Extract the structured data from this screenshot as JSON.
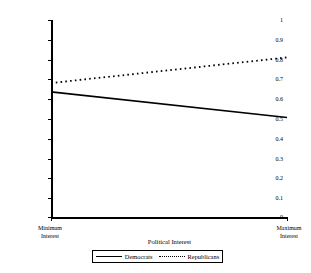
{
  "chart_data": {
    "type": "line",
    "title": "",
    "xlabel": "Political Interest",
    "ylabel": "U.S. Involvement in Iraq is Going Well",
    "xlim": [
      0,
      1
    ],
    "ylim": [
      0,
      1
    ],
    "grid": false,
    "legend_position": "bottom-center",
    "x_tick_labels": [
      "Minimum\nInterest",
      "Maximum\nInterest"
    ],
    "y_tick_labels": [
      "0",
      "0.1",
      "0.2",
      "0.3",
      "0.4",
      "0.5",
      "0.6",
      "0.7",
      "0.8",
      "0.9",
      "1"
    ],
    "y_tick_values": [
      0,
      0.1,
      0.2,
      0.3,
      0.4,
      0.5,
      0.6,
      0.7,
      0.8,
      0.9,
      1
    ],
    "x": [
      0,
      1
    ],
    "series": [
      {
        "name": "Democrats",
        "style": "solid",
        "color": "#000000",
        "values": [
          0.635,
          0.505
        ]
      },
      {
        "name": "Republicans",
        "style": "dotted",
        "color": "#000000",
        "values": [
          0.68,
          0.81
        ]
      }
    ]
  },
  "axes": {
    "y_title": "U.S. Involvement in Iraq is Going Well",
    "x_title": "Political Interest",
    "x_min_label_line1": "Minimum",
    "x_min_label_line2": "Interest",
    "x_max_label_line1": "Maximum",
    "x_max_label_line2": "Interest"
  },
  "legend": {
    "democrats_label": "Democrats",
    "republicans_label": "Republicans"
  }
}
